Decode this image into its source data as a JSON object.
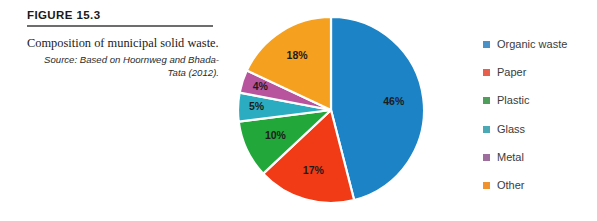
{
  "figure": {
    "number_label": "FIGURE 15.3",
    "caption": "Composition of municipal solid waste.",
    "source": "Source: Based on Hoornweg and Bhada-Tata (2012).",
    "rule_color": "#6d6d6d"
  },
  "legend": {
    "position": "right",
    "items": [
      {
        "label": "Organic waste",
        "swatch_color": "#4a91c8"
      },
      {
        "label": "Paper",
        "swatch_color": "#e8604c"
      },
      {
        "label": "Plastic",
        "swatch_color": "#4f9e5b"
      },
      {
        "label": "Glass",
        "swatch_color": "#4aa9b5"
      },
      {
        "label": "Metal",
        "swatch_color": "#9e6f9e"
      },
      {
        "label": "Other",
        "swatch_color": "#f0922e"
      }
    ]
  },
  "chart_data": {
    "type": "pie",
    "title": "Composition of municipal solid waste",
    "xlabel": "",
    "ylabel": "",
    "units": "percent",
    "start_angle_deg": 0,
    "direction": "clockwise",
    "separator_color": "#ffffff",
    "categories": [
      "Organic waste",
      "Paper",
      "Plastic",
      "Glass",
      "Metal",
      "Other"
    ],
    "values": [
      46,
      17,
      10,
      5,
      4,
      18
    ],
    "data_labels": [
      "46%",
      "17%",
      "10%",
      "5%",
      "4%",
      "18%"
    ],
    "colors": [
      "#1b83c6",
      "#f03b16",
      "#21a73a",
      "#2bacc0",
      "#b8549e",
      "#f5a01e"
    ],
    "slices": [
      {
        "name": "Organic waste",
        "value": 46,
        "label": "46%",
        "color": "#1b83c6"
      },
      {
        "name": "Paper",
        "value": 17,
        "label": "17%",
        "color": "#f03b16"
      },
      {
        "name": "Plastic",
        "value": 10,
        "label": "10%",
        "color": "#21a73a"
      },
      {
        "name": "Glass",
        "value": 5,
        "label": "5%",
        "color": "#2bacc0"
      },
      {
        "name": "Metal",
        "value": 4,
        "label": "4%",
        "color": "#b8549e"
      },
      {
        "name": "Other",
        "value": 18,
        "label": "18%",
        "color": "#f5a01e"
      }
    ]
  }
}
